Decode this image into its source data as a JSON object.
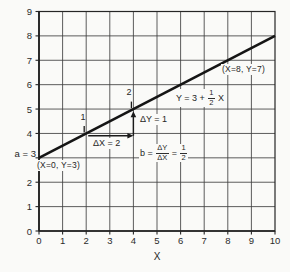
{
  "figure": {
    "background": "#fafaf8",
    "ink": "#2b2b2b",
    "grid_color": "#404040",
    "line_color": "#151515"
  },
  "chart_data": {
    "type": "line",
    "title": "",
    "xlabel": "X",
    "ylabel": "",
    "xlim": [
      0,
      10
    ],
    "ylim": [
      0,
      9
    ],
    "grid": true,
    "x_ticks": [
      0,
      1,
      2,
      3,
      4,
      5,
      6,
      7,
      8,
      9,
      10
    ],
    "y_ticks": [
      0,
      1,
      2,
      4,
      5,
      6,
      7,
      8,
      9
    ],
    "series": [
      {
        "name": "Y = 3 + (1/2) X",
        "slope": 0.5,
        "intercept": 3,
        "x": [
          0,
          10
        ],
        "y": [
          3,
          8
        ]
      }
    ],
    "points": [
      {
        "label": "1",
        "x": 2,
        "y": 4
      },
      {
        "label": "2",
        "x": 4,
        "y": 5
      }
    ],
    "slope_triangle": {
      "run_from": [
        2,
        4
      ],
      "corner": [
        4,
        4
      ],
      "rise_to": [
        4,
        5
      ]
    },
    "annotations": {
      "intercept": "a = 3",
      "origin_point": "(X=0, Y=3)",
      "known_point": "(X=8, Y=7)",
      "dx": "ΔX = 2",
      "dy": "ΔY = 1",
      "x_axis_title": "X",
      "line_equation": {
        "prefix": "Y = 3 +",
        "frac_num": "1",
        "frac_den": "2",
        "suffix": "X"
      },
      "slope_equation": {
        "prefix": "b =",
        "frac1_num": "ΔY",
        "frac1_den": "ΔX",
        "equals": "=",
        "frac2_num": "1",
        "frac2_den": "2"
      }
    }
  }
}
